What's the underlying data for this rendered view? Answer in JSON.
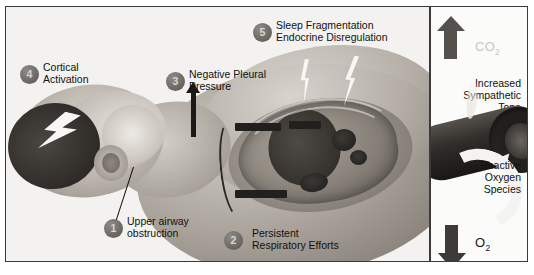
{
  "left_panel": {
    "callouts": [
      {
        "number": "1",
        "label": "Upper airway\nobstruction"
      },
      {
        "number": "2",
        "label": "Persistent\nRespiratory Efforts"
      },
      {
        "number": "3",
        "label": "Negative Pleural\nPressure"
      },
      {
        "number": "4",
        "label": "Cortical\nActivation"
      },
      {
        "number": "5",
        "label": "Sleep Fragmentation\nEndocrine Disregulation"
      }
    ]
  },
  "right_panel": {
    "co2_label": "CO",
    "co2_sub": "2",
    "o2_label": "O",
    "o2_sub": "2",
    "sympathetic_tone": "Increased\nSympathetic\nTone",
    "reactive_oxygen": "Reactive\nOxygen\nSpecies",
    "up_arrow": "arrow-up",
    "down_arrow": "arrow-down"
  },
  "colors": {
    "frame": "#3a3a3a",
    "badge": "#6d6964",
    "text": "#111110",
    "co2_text": "#c9c7c4",
    "o2_text": "#1a1917",
    "arrow_up": "#55524e",
    "arrow_down": "#3d3a37",
    "bolt": "#f7f7f5"
  }
}
